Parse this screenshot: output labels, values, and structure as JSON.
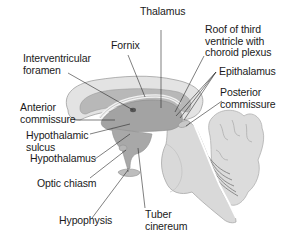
{
  "diagram": {
    "colors": {
      "outer_fill": "#e3e3e3",
      "inner_fill": "#b8b8b8",
      "dark_fill": "#a3a3a3",
      "brainstem_fill": "#d9d9d9",
      "cerebellum_fill": "#dcdcdc",
      "outline": "#9a9a9a",
      "leader_line": "#2a2a2a",
      "text": "#1a1a1a"
    },
    "labels": {
      "thalamus": "Thalamus",
      "fornix": "Fornix",
      "roof": "Roof of third\nventricle with\nchoroid plexus",
      "interventricular_foramen": "Interventricular\nforamen",
      "epithalamus": "Epithalamus",
      "anterior_commissure": "Anterior\ncommissure",
      "posterior_commissure": "Posterior\ncommissure",
      "hypothalamic_sulcus": "Hypothalamic\nsulcus",
      "hypothalamus": "Hypothalamus",
      "optic_chiasm": "Optic chiasm",
      "hypophysis": "Hypophysis",
      "tuber_cinereum": "Tuber\ncinereum"
    }
  }
}
